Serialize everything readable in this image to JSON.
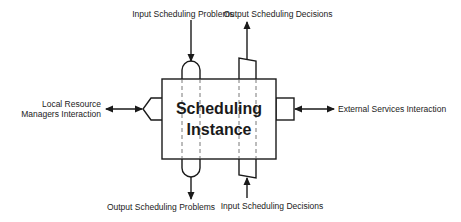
{
  "diagram": {
    "central_component": {
      "title_line1": "Scheduling",
      "title_line2": "Instance"
    },
    "interfaces": {
      "top_left": "Input Scheduling Problems",
      "top_right": "Output Scheduling Decisions",
      "bottom_left": "Output Scheduling Problems",
      "bottom_right": "Input Scheduling Decisions",
      "left_line1": "Local Resource",
      "left_line2": "Managers Interaction",
      "right": "External Services Interaction"
    },
    "ports": {
      "problem_port_shape": "capsule",
      "decision_port_shape": "trapezoid",
      "local_port_shape": "chevron",
      "external_port_shape": "rectangle"
    },
    "arrows": [
      {
        "from": "Input Scheduling Problems",
        "to": "Scheduling Instance",
        "direction": "down"
      },
      {
        "from": "Scheduling Instance",
        "to": "Output Scheduling Decisions",
        "direction": "up"
      },
      {
        "from": "Scheduling Instance",
        "to": "Output Scheduling Problems",
        "direction": "down"
      },
      {
        "from": "Input Scheduling Decisions",
        "to": "Scheduling Instance",
        "direction": "up"
      },
      {
        "from": "Local Resource Managers Interaction",
        "to": "Scheduling Instance",
        "direction": "bidirectional"
      },
      {
        "from": "External Services Interaction",
        "to": "Scheduling Instance",
        "direction": "bidirectional"
      }
    ],
    "colors": {
      "stroke": "#1a1a1a",
      "background": "#ffffff",
      "dashed": "#555555"
    }
  }
}
